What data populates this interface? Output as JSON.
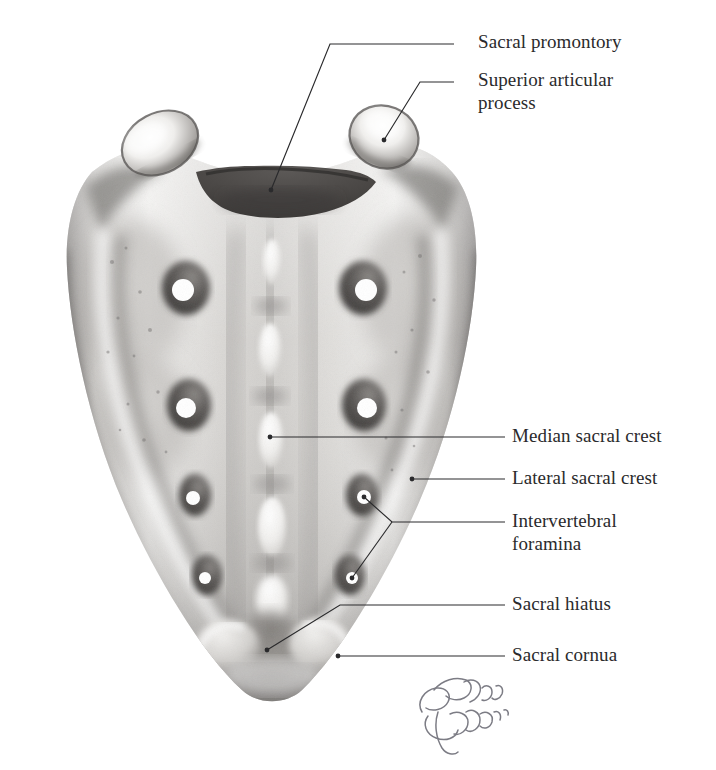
{
  "figure": {
    "style": "graphite pencil anatomical illustration",
    "background_color": "#ffffff",
    "ink_color": "#2a2a2c",
    "bone_light": "#f4f3f1",
    "bone_mid": "#b9b7b4",
    "bone_dark": "#6f6d6b",
    "promontory_color": "#4a4846",
    "signature": {
      "name": "signature",
      "description": "cursive artist signature, lower right of bone",
      "color": "#6a6a74"
    }
  },
  "labels": [
    {
      "id": "sacral-promontory",
      "text": "Sacral promontory",
      "x": 478,
      "y": 30,
      "leader": {
        "hx1": 454,
        "hx2": 330,
        "hy": 44,
        "tx": 271,
        "ty": 190
      }
    },
    {
      "id": "superior-articular-process",
      "text": "Superior articular\nprocess",
      "x": 478,
      "y": 68,
      "leader": {
        "hx1": 454,
        "hx2": 420,
        "hy": 82,
        "tx": 384,
        "ty": 140
      }
    },
    {
      "id": "median-sacral-crest",
      "text": "Median sacral crest",
      "x": 512,
      "y": 424,
      "leader": {
        "hx1": 505,
        "hx2": 300,
        "hy": 437,
        "tx": 270,
        "ty": 437
      }
    },
    {
      "id": "lateral-sacral-crest",
      "text": "Lateral sacral crest",
      "x": 512,
      "y": 466,
      "leader": {
        "hx1": 505,
        "hx2": 430,
        "hy": 479,
        "tx": 412,
        "ty": 479
      }
    },
    {
      "id": "intervertebral-foramina",
      "text": "Intervertebral\nforamina",
      "x": 512,
      "y": 509,
      "leader": {
        "hx1": 505,
        "hx2": 392,
        "hy": 522,
        "tx1": 364,
        "ty1": 497,
        "tx2": 352,
        "ty2": 578
      }
    },
    {
      "id": "sacral-hiatus",
      "text": "Sacral hiatus",
      "x": 512,
      "y": 592,
      "leader": {
        "hx1": 505,
        "hx2": 340,
        "hy": 605,
        "tx": 267,
        "ty": 650
      }
    },
    {
      "id": "sacral-cornua",
      "text": "Sacral cornua",
      "x": 512,
      "y": 643,
      "leader": {
        "hx1": 505,
        "hx2": 360,
        "hy": 656,
        "tx": 338,
        "ty": 656
      }
    }
  ],
  "anatomy": {
    "superior_articular_processes": [
      {
        "side": "left",
        "cx": 160,
        "cy": 143,
        "rx": 40,
        "ry": 29,
        "rot": -28
      },
      {
        "side": "right",
        "cx": 384,
        "cy": 137,
        "rx": 35,
        "ry": 30,
        "rot": 22
      }
    ],
    "promontory": {
      "cx": 272,
      "cy": 183,
      "note": "dark concave body surface between the articular processes"
    },
    "median_crest_tubercles": [
      {
        "cy": 262,
        "w": 17,
        "h": 44
      },
      {
        "cy": 350,
        "w": 21,
        "h": 52
      },
      {
        "cy": 440,
        "w": 23,
        "h": 54
      },
      {
        "cy": 527,
        "w": 27,
        "h": 58
      },
      {
        "cy": 600,
        "w": 30,
        "h": 48
      }
    ],
    "posterior_sacral_foramina": [
      {
        "row": 1,
        "left_cx": 183,
        "right_cx": 366,
        "cy": 290,
        "r": 11
      },
      {
        "row": 2,
        "left_cx": 186,
        "right_cx": 367,
        "cy": 408,
        "r": 10
      },
      {
        "row": 3,
        "left_cx": 193,
        "right_cx": 364,
        "cy": 498,
        "r": 7
      },
      {
        "row": 4,
        "left_cx": 205,
        "right_cx": 352,
        "cy": 578,
        "r": 6
      }
    ],
    "sacral_hiatus": {
      "cx": 272,
      "cy": 648,
      "w": 78,
      "h": 46
    },
    "sacral_cornua": [
      {
        "side": "left",
        "cx": 232,
        "cy": 650
      },
      {
        "side": "right",
        "cx": 322,
        "cy": 648
      }
    ],
    "apex": {
      "cx": 272,
      "cy": 690
    }
  }
}
